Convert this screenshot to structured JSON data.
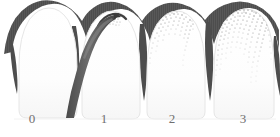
{
  "figure": {
    "kind": "gingival-index-illustration",
    "background_color": "#ffffff",
    "gum_color": "#4d4d4d",
    "gum_color_light": "#6a6a6a",
    "tooth_color": "#fdfdfd",
    "tooth_outline_color": "#e2e2e2",
    "probe_color": "#5a5a5a",
    "probe_color_dark": "#3f3f3f",
    "stipple_color": "#8c8c8c",
    "label_color": "#6f6f6f"
  },
  "labels": [
    {
      "id": "label-0",
      "text": "0",
      "x": 31,
      "y": 119
    },
    {
      "id": "label-1",
      "text": "1",
      "x": 103,
      "y": 119
    },
    {
      "id": "label-2",
      "text": "2",
      "x": 171,
      "y": 119
    },
    {
      "id": "label-3",
      "text": "3",
      "x": 242,
      "y": 119
    }
  ],
  "teeth": [
    {
      "index": 0,
      "score": "0",
      "name": "tooth-score-0",
      "description": "healthy gingiva, no inflammation, no stippling",
      "left": 20,
      "right": 75,
      "stipple_count": 0
    },
    {
      "index": 1,
      "score": "1",
      "name": "tooth-score-1",
      "description": "mild inflammation, periodontal probe inserted in sulcus, slight stippling",
      "left": 75,
      "right": 140,
      "stipple_count": 14
    },
    {
      "index": 2,
      "score": "2",
      "name": "tooth-score-2",
      "description": "moderate inflammation, moderate stippling along gingival margin",
      "left": 140,
      "right": 205,
      "stipple_count": 70
    },
    {
      "index": 3,
      "score": "3",
      "name": "tooth-score-3",
      "description": "severe inflammation, dense stippling over crown",
      "left": 205,
      "right": 272,
      "stipple_count": 150
    }
  ],
  "probe": {
    "name": "periodontal-probe",
    "tip_x": 114,
    "tip_y": 16,
    "handle_x": 72,
    "handle_y": 118
  }
}
